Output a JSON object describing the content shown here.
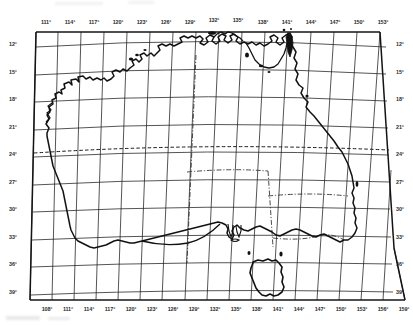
{
  "figure": {
    "projection_note": "graticule map of Australia with latitude and longitude grid",
    "background_color": "#ffffff",
    "line_color": "#1a1a1a"
  },
  "axes": {
    "top": {
      "name": "longitude-top-axis",
      "unit": "degrees east",
      "labels": [
        "111°",
        "114°",
        "117°",
        "120°",
        "123°",
        "126°",
        "129°",
        "132°",
        "135°",
        "138°",
        "141°",
        "144°",
        "147°",
        "150°",
        "153°"
      ]
    },
    "bottom": {
      "name": "longitude-bottom-axis",
      "unit": "degrees east",
      "labels": [
        "108°",
        "111°",
        "114°",
        "117°",
        "120°",
        "123°",
        "126°",
        "129°",
        "132°",
        "135°",
        "138°",
        "141°",
        "144°",
        "147°",
        "150°",
        "153°",
        "156°",
        "159°"
      ]
    },
    "left": {
      "name": "latitude-left-axis",
      "unit": "degrees south",
      "labels": [
        "12°",
        "15°",
        "18°",
        "21°",
        "24°",
        "27°",
        "30°",
        "33°",
        "36°",
        "39°"
      ]
    },
    "right": {
      "name": "latitude-right-axis",
      "unit": "degrees south",
      "labels": [
        "12°",
        "15°",
        "18°",
        "21°",
        "24°",
        "27°",
        "30°",
        "33°",
        "36°",
        "39°"
      ]
    }
  },
  "label_positions": {
    "top": [
      {
        "text": "111°",
        "x": 46,
        "y": 19
      },
      {
        "text": "114°",
        "x": 70,
        "y": 19
      },
      {
        "text": "117°",
        "x": 94,
        "y": 19
      },
      {
        "text": "120°",
        "x": 118,
        "y": 19
      },
      {
        "text": "123°",
        "x": 142,
        "y": 19
      },
      {
        "text": "126°",
        "x": 166,
        "y": 19
      },
      {
        "text": "129°",
        "x": 190,
        "y": 19
      },
      {
        "text": "132°",
        "x": 214,
        "y": 17
      },
      {
        "text": "135°",
        "x": 238,
        "y": 17
      },
      {
        "text": "138°",
        "x": 263,
        "y": 19
      },
      {
        "text": "141°",
        "x": 287,
        "y": 19
      },
      {
        "text": "144°",
        "x": 311,
        "y": 19
      },
      {
        "text": "147°",
        "x": 335,
        "y": 19
      },
      {
        "text": "150°",
        "x": 359,
        "y": 19
      },
      {
        "text": "153°",
        "x": 383,
        "y": 19
      }
    ],
    "bottom": [
      {
        "text": "108°",
        "x": 47,
        "y": 306
      },
      {
        "text": "111°",
        "x": 68,
        "y": 306
      },
      {
        "text": "114°",
        "x": 89,
        "y": 306
      },
      {
        "text": "117°",
        "x": 110,
        "y": 306
      },
      {
        "text": "120°",
        "x": 131,
        "y": 306
      },
      {
        "text": "123°",
        "x": 152,
        "y": 306
      },
      {
        "text": "126°",
        "x": 173,
        "y": 306
      },
      {
        "text": "129°",
        "x": 194,
        "y": 306
      },
      {
        "text": "132°",
        "x": 215,
        "y": 306
      },
      {
        "text": "135°",
        "x": 236,
        "y": 306
      },
      {
        "text": "138°",
        "x": 257,
        "y": 306
      },
      {
        "text": "141°",
        "x": 278,
        "y": 306
      },
      {
        "text": "144°",
        "x": 299,
        "y": 306
      },
      {
        "text": "147°",
        "x": 320,
        "y": 306
      },
      {
        "text": "150°",
        "x": 341,
        "y": 306
      },
      {
        "text": "153°",
        "x": 362,
        "y": 306
      },
      {
        "text": "156°",
        "x": 383,
        "y": 306
      },
      {
        "text": "159°",
        "x": 404,
        "y": 306
      }
    ],
    "left": [
      {
        "text": "12°",
        "x": 9,
        "y": 44
      },
      {
        "text": "15°",
        "x": 9,
        "y": 72
      },
      {
        "text": "18°",
        "x": 9,
        "y": 99
      },
      {
        "text": "21°",
        "x": 9,
        "y": 127
      },
      {
        "text": "24°",
        "x": 9,
        "y": 154
      },
      {
        "text": "27°",
        "x": 9,
        "y": 182
      },
      {
        "text": "30°",
        "x": 9,
        "y": 209
      },
      {
        "text": "33°",
        "x": 9,
        "y": 237
      },
      {
        "text": "36°",
        "x": 9,
        "y": 264
      },
      {
        "text": "39°",
        "x": 9,
        "y": 292
      }
    ],
    "right": [
      {
        "text": "12°",
        "x": 396,
        "y": 44
      },
      {
        "text": "15°",
        "x": 396,
        "y": 72
      },
      {
        "text": "18°",
        "x": 396,
        "y": 99
      },
      {
        "text": "21°",
        "x": 396,
        "y": 127
      },
      {
        "text": "24°",
        "x": 396,
        "y": 154
      },
      {
        "text": "27°",
        "x": 396,
        "y": 182
      },
      {
        "text": "30°",
        "x": 396,
        "y": 209
      },
      {
        "text": "33°",
        "x": 396,
        "y": 237
      },
      {
        "text": "36°",
        "x": 396,
        "y": 264
      },
      {
        "text": "39°",
        "x": 396,
        "y": 292
      }
    ]
  },
  "map_features": {
    "graticule": {
      "name": "graticule-grid",
      "visible": true,
      "meridian_spacing_degrees": 3,
      "parallel_spacing_degrees": 3,
      "stroke": "#1a1a1a",
      "stroke_width": 0.7
    },
    "coastline": {
      "name": "australia-coastline",
      "visible": true,
      "stroke": "#111111",
      "stroke_width": 1.4
    },
    "tasmania": {
      "name": "tasmania-coastline",
      "visible": true
    },
    "tropic_of_capricorn": {
      "name": "tropic-of-capricorn-line",
      "visible": true,
      "style": "dashed",
      "latitude": "23.5° S"
    },
    "state_borders": {
      "name": "state-borders",
      "visible": true,
      "style": "dash-dot"
    }
  }
}
